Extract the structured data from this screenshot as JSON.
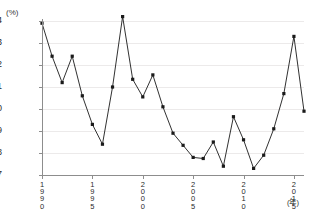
{
  "chart_data": {
    "type": "line",
    "title": "",
    "xlabel": "(年)",
    "ylabel": "(%)",
    "yunit": "(%)",
    "xunit": "(年)",
    "ylim": [
      7,
      14
    ],
    "xlim": [
      1990,
      2016
    ],
    "grid": true,
    "legend": "none",
    "yticks": [
      7,
      8,
      9,
      10,
      11,
      12,
      13,
      14
    ],
    "ytick_labels": [
      "7",
      "8",
      "9",
      "10",
      "11",
      "12",
      "13",
      "14"
    ],
    "xticks": [
      1990,
      1995,
      2000,
      2005,
      2010,
      2015
    ],
    "xtick_labels": [
      "1990",
      "1995",
      "2000",
      "2005",
      "2010",
      "2015"
    ],
    "marker": "filled-square",
    "line_color": "#1a1a1a",
    "grid_color": "#eceaea",
    "axis_color": "#8d8d8d",
    "x": [
      1990,
      1991,
      1992,
      1993,
      1994,
      1995,
      1996,
      1997,
      1998,
      1999,
      2000,
      2001,
      2002,
      2003,
      2004,
      2005,
      2006,
      2007,
      2008,
      2009,
      2010,
      2011,
      2012,
      2013,
      2014,
      2015,
      2016
    ],
    "values": [
      13.9,
      12.4,
      11.2,
      12.4,
      10.6,
      9.3,
      8.4,
      11.0,
      14.2,
      11.35,
      10.55,
      11.55,
      10.1,
      8.9,
      8.35,
      7.8,
      7.75,
      8.5,
      7.4,
      9.65,
      8.6,
      7.3,
      7.9,
      9.1,
      10.7,
      13.3,
      9.9
    ]
  }
}
